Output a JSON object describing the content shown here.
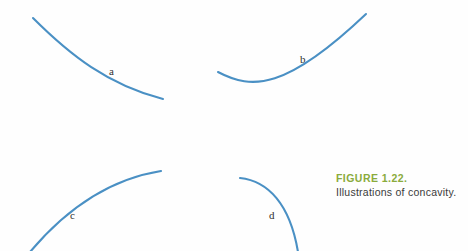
{
  "figure": {
    "caption_title": "FIGURE 1.22.",
    "caption_text": "Illustrations of concavity.",
    "caption_title_color": "#8aab3c",
    "caption_text_color": "#3a3a3a",
    "background_color": "#fefefe",
    "curve_color": "#4a90c4",
    "curve_stroke_width": 2.1
  },
  "labels": {
    "a": "a",
    "b": "b",
    "c": "c",
    "d": "d"
  },
  "chart_data": {
    "type": "line",
    "title": "Illustrations of concavity.",
    "xlabel": "",
    "ylabel": "",
    "grid": false,
    "legend": "none",
    "axis_shown": false,
    "series": [
      {
        "name": "a",
        "label": "a",
        "concavity": "concave down",
        "trend": "decreasing",
        "color": "#4a90c4",
        "label_position": [
          112,
          72
        ],
        "path": "M 33 18 C 70 55, 108 85, 163 99",
        "endpoints": [
          [
            33,
            18
          ],
          [
            163,
            99
          ]
        ]
      },
      {
        "name": "b",
        "label": "b",
        "concavity": "concave up",
        "trend": "decreasing then increasing",
        "color": "#4a90c4",
        "label_position": [
          303,
          60
        ],
        "path": "M 218 72 C 252 90, 286 90, 366 14",
        "endpoints": [
          [
            218,
            72
          ],
          [
            366,
            14
          ]
        ]
      },
      {
        "name": "c",
        "label": "c",
        "concavity": "concave down",
        "trend": "increasing",
        "color": "#4a90c4",
        "label_position": [
          73,
          216
        ],
        "path": "M 30 252 C 62 214, 104 180, 161 171",
        "endpoints": [
          [
            30,
            252
          ],
          [
            161,
            171
          ]
        ]
      },
      {
        "name": "d",
        "label": "d",
        "concavity": "concave down",
        "trend": "decreasing",
        "color": "#4a90c4",
        "label_position": [
          272,
          216
        ],
        "path": "M 240 178 C 268 181, 290 204, 298 252",
        "endpoints": [
          [
            240,
            178
          ],
          [
            298,
            252
          ]
        ]
      }
    ]
  }
}
